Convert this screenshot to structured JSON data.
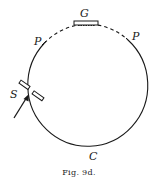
{
  "figure": {
    "caption": "Fig. 9d.",
    "labels": {
      "grating": "G",
      "pole_left": "P",
      "pole_right": "P",
      "slit": "S",
      "circle": "C"
    },
    "elements": {
      "circle": "Rowland circle (solid, with dashed arc between P points)",
      "grating": "plate G at top of circle",
      "slit": "slit S at left of circle with incoming arrow",
      "arrow": "incident light direction"
    },
    "colors": {
      "ink": "#1a1a1a",
      "background": "#ffffff"
    }
  }
}
